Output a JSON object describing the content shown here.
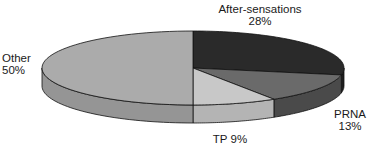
{
  "chart_data": {
    "type": "pie",
    "style": "3d",
    "title": "",
    "categories": [
      "After-sensations",
      "PRNA",
      "TP",
      "Other"
    ],
    "values": [
      28,
      13,
      9,
      50
    ],
    "labels": [
      "After-sensations\n28%",
      "PRNA\n13%",
      "TP 9%",
      "Other\n50%"
    ],
    "colors": [
      "#2a2a2a",
      "#6a6a6a",
      "#c8c8c8",
      "#ababab"
    ],
    "side_colors": [
      "#1e1e1e",
      "#4a4a4a",
      "#b4b4b4",
      "#959595"
    ],
    "legend": "none",
    "start_angle": "12 o'clock, clockwise"
  },
  "labels": {
    "after_line1": "After-sensations",
    "after_line2": "28%",
    "prna_line1": "PRNA",
    "prna_line2": "13%",
    "tp": "TP 9%",
    "other_line1": "Other",
    "other_line2": "50%"
  }
}
